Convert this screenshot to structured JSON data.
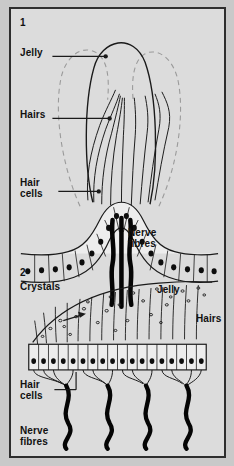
{
  "figure": {
    "background_color": "#dcdcdc",
    "border_color": "#2e2e2e",
    "ink_color": "#111111"
  },
  "panel1": {
    "number": "1",
    "labels": {
      "jelly": "Jelly",
      "hairs": "Hairs",
      "hair_cells": "Hair\ncells",
      "nerve_fibres": "Nerve\nfibres"
    }
  },
  "panel2": {
    "number": "2",
    "labels": {
      "crystals": "Crystals",
      "jelly": "Jelly",
      "hairs": "Hairs",
      "hair_cells": "Hair\ncells",
      "nerve_fibres": "Nerve\nfibres"
    }
  }
}
